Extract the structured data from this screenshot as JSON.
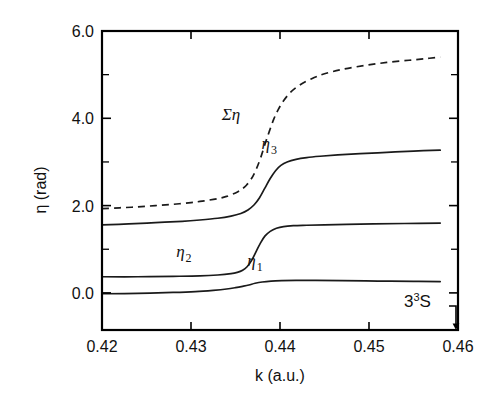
{
  "figure": {
    "background_color": "#ffffff",
    "ink_color": "#111111"
  },
  "chart_data": {
    "type": "line",
    "title": "",
    "subtitle": "",
    "xlabel": "k (a.u.)",
    "ylabel": "η (rad)",
    "xlim": [
      0.42,
      0.46
    ],
    "ylim": [
      -0.85,
      6.0
    ],
    "grid": false,
    "legend_position": "inline-annotations",
    "xticks": [
      0.42,
      0.43,
      0.44,
      0.45,
      0.46
    ],
    "xtick_labels": [
      "0.42",
      "0.43",
      "0.44",
      "0.45",
      "0.46"
    ],
    "yticks": [
      0.0,
      2.0,
      4.0,
      6.0
    ],
    "ytick_labels": [
      "0.0",
      "2.0",
      "4.0",
      "6.0"
    ],
    "yticks_minor": [
      1.0,
      3.0,
      5.0
    ],
    "annotations": [
      {
        "text": "3³S",
        "x": 0.4545,
        "y": -0.18,
        "meaning": "resonance-state-label"
      }
    ],
    "series": [
      {
        "name": "Ση",
        "label": "Ση",
        "style": "dashed",
        "color": "#1a1a1a",
        "label_x": 0.4345,
        "label_y": 3.95,
        "x": [
          0.42,
          0.422,
          0.424,
          0.426,
          0.428,
          0.43,
          0.4315,
          0.433,
          0.434,
          0.435,
          0.4356,
          0.4362,
          0.4368,
          0.4373,
          0.4378,
          0.4383,
          0.4388,
          0.4393,
          0.4398,
          0.4404,
          0.4412,
          0.4422,
          0.4435,
          0.445,
          0.447,
          0.4495,
          0.452,
          0.4545,
          0.4565,
          0.458
        ],
        "y": [
          1.93,
          1.95,
          1.97,
          2.0,
          2.03,
          2.07,
          2.11,
          2.16,
          2.21,
          2.29,
          2.36,
          2.46,
          2.62,
          2.82,
          3.08,
          3.4,
          3.7,
          3.98,
          4.2,
          4.4,
          4.6,
          4.76,
          4.9,
          5.02,
          5.12,
          5.21,
          5.28,
          5.33,
          5.37,
          5.4
        ]
      },
      {
        "name": "η₃",
        "label": "η",
        "sublabel": "3",
        "style": "solid",
        "color": "#1a1a1a",
        "label_x": 0.4388,
        "label_y": 3.3,
        "x": [
          0.42,
          0.423,
          0.426,
          0.429,
          0.431,
          0.433,
          0.4345,
          0.4356,
          0.4364,
          0.4371,
          0.4377,
          0.4383,
          0.4389,
          0.4395,
          0.4401,
          0.4408,
          0.4418,
          0.443,
          0.4445,
          0.4465,
          0.449,
          0.452,
          0.455,
          0.458
        ],
        "y": [
          1.56,
          1.58,
          1.61,
          1.64,
          1.67,
          1.71,
          1.76,
          1.82,
          1.9,
          2.02,
          2.18,
          2.4,
          2.62,
          2.8,
          2.92,
          3.0,
          3.06,
          3.1,
          3.13,
          3.16,
          3.19,
          3.22,
          3.25,
          3.27
        ]
      },
      {
        "name": "η₂",
        "label": "η",
        "sublabel": "2",
        "style": "solid",
        "color": "#1a1a1a",
        "label_x": 0.4292,
        "label_y": 0.82,
        "x": [
          0.42,
          0.424,
          0.428,
          0.431,
          0.433,
          0.4345,
          0.4352,
          0.4358,
          0.4363,
          0.4368,
          0.4373,
          0.4378,
          0.4383,
          0.4389,
          0.4396,
          0.4404,
          0.4415,
          0.443,
          0.445,
          0.4475,
          0.4505,
          0.454,
          0.458
        ],
        "y": [
          0.37,
          0.37,
          0.38,
          0.39,
          0.41,
          0.44,
          0.47,
          0.52,
          0.6,
          0.74,
          0.94,
          1.14,
          1.3,
          1.41,
          1.48,
          1.52,
          1.54,
          1.55,
          1.56,
          1.57,
          1.58,
          1.59,
          1.6
        ]
      },
      {
        "name": "η₁",
        "label": "η",
        "sublabel": "1",
        "style": "solid",
        "color": "#1a1a1a",
        "label_x": 0.4372,
        "label_y": 0.62,
        "x": [
          0.42,
          0.424,
          0.428,
          0.4305,
          0.4325,
          0.434,
          0.435,
          0.4358,
          0.4365,
          0.4372,
          0.438,
          0.439,
          0.4402,
          0.4418,
          0.444,
          0.447,
          0.451,
          0.455,
          0.458
        ],
        "y": [
          -0.02,
          -0.01,
          0.01,
          0.03,
          0.06,
          0.09,
          0.12,
          0.15,
          0.18,
          0.22,
          0.25,
          0.27,
          0.28,
          0.285,
          0.285,
          0.28,
          0.27,
          0.265,
          0.26
        ]
      }
    ]
  }
}
